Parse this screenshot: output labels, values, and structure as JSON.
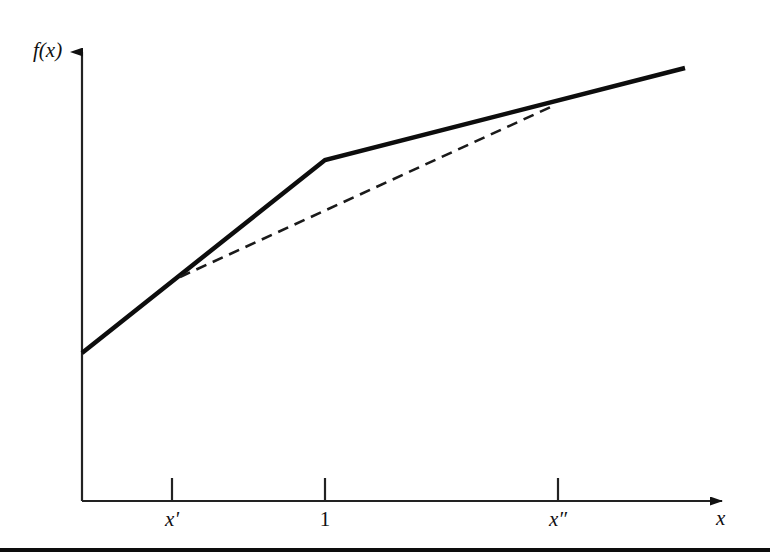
{
  "figure": {
    "axes": {
      "y_axis_label": "f(x)",
      "x_axis_label": "x",
      "y_axis": {
        "x": 82,
        "y_top": 45,
        "y_bottom": 501
      },
      "x_axis": {
        "y": 501,
        "x_left": 82,
        "x_right": 735
      },
      "arrow_color": "#111111",
      "axis_color": "#222222"
    },
    "ticks": [
      {
        "label": "x'",
        "x": 172,
        "italic": true
      },
      {
        "label": "1",
        "x": 325,
        "italic": false
      },
      {
        "label": "x″",
        "x": 558,
        "italic": true
      }
    ],
    "bottom_rule_color": "#0d0d0d"
  },
  "chart_data": {
    "type": "line",
    "title": "",
    "xlabel": "x",
    "ylabel": "f(x)",
    "xlim": [
      0,
      735
    ],
    "ylim": [
      0,
      501
    ],
    "grid": false,
    "legend": null,
    "tick_labels": {
      "x": [
        "x'",
        "1",
        "x″"
      ],
      "y": []
    },
    "annotations": [
      "Piecewise-linear convex function f(x) with a kink at x = 1",
      "Dashed chord joins the points (x', f(x')) and (x″, f(x″))"
    ],
    "series": [
      {
        "name": "f(x) piecewise-linear",
        "style": "solid",
        "color": "#0d0d0d",
        "width": 4.5,
        "points_px": [
          {
            "x": 82,
            "y": 353
          },
          {
            "x": 325,
            "y": 160
          },
          {
            "x": 685,
            "y": 68
          }
        ]
      },
      {
        "name": "chord from x' to x″",
        "style": "dashed",
        "color": "#1a1a1a",
        "width": 2.6,
        "dash": "11 7",
        "points_px": [
          {
            "x": 180,
            "y": 277
          },
          {
            "x": 555,
            "y": 105
          }
        ]
      }
    ],
    "marked_points": [
      {
        "name": "x-prime",
        "x_px": 172,
        "y_px": 277
      },
      {
        "name": "one",
        "x_px": 325,
        "y_px": 160
      },
      {
        "name": "x-double-prime",
        "x_px": 558,
        "y_px": 105
      }
    ]
  }
}
